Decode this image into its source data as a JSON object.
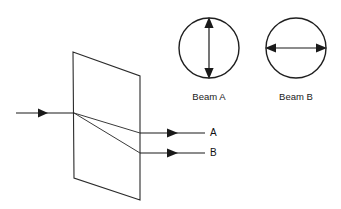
{
  "figure": {
    "background_color": "#ffffff",
    "line_color": "#2b2b2b",
    "width": 341,
    "height": 209
  },
  "crystal": {
    "name": "crystal-plate",
    "shape": "parallelogram",
    "corners": [
      {
        "x": 73,
        "y": 52
      },
      {
        "x": 140,
        "y": 76
      },
      {
        "x": 140,
        "y": 200
      },
      {
        "x": 74,
        "y": 178
      }
    ]
  },
  "incident_beam": {
    "label": "",
    "start": {
      "x": 16,
      "y": 113
    },
    "end": {
      "x": 74,
      "y": 113
    },
    "arrow_at": {
      "x": 46,
      "y": 113
    }
  },
  "internal_rays": [
    {
      "name": "ray-to-a",
      "start": {
        "x": 74,
        "y": 113
      },
      "end": {
        "x": 140,
        "y": 133
      }
    },
    {
      "name": "ray-to-b",
      "start": {
        "x": 74,
        "y": 113
      },
      "end": {
        "x": 140,
        "y": 153
      }
    }
  ],
  "output_beams": [
    {
      "label": "A",
      "start": {
        "x": 140,
        "y": 133
      },
      "end": {
        "x": 205,
        "y": 133
      },
      "arrow_at": {
        "x": 176,
        "y": 133
      },
      "label_pos": {
        "x": 210,
        "y": 133
      }
    },
    {
      "label": "B",
      "start": {
        "x": 140,
        "y": 153
      },
      "end": {
        "x": 205,
        "y": 153
      },
      "arrow_at": {
        "x": 176,
        "y": 153
      },
      "label_pos": {
        "x": 210,
        "y": 153
      }
    }
  ],
  "polarization_diagrams": [
    {
      "caption": "Beam A",
      "center": {
        "x": 209,
        "y": 48
      },
      "radius": 30,
      "orientation": "vertical",
      "caption_pos": {
        "x": 209,
        "y": 100
      }
    },
    {
      "caption": "Beam B",
      "center": {
        "x": 296,
        "y": 48
      },
      "radius": 30,
      "orientation": "horizontal",
      "caption_pos": {
        "x": 296,
        "y": 100
      }
    }
  ]
}
